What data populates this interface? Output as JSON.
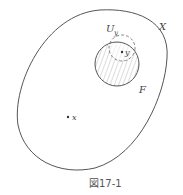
{
  "figure": {
    "caption": "図17-1",
    "labels": {
      "space": "X",
      "neighborhood": "U",
      "neighborhood_sub": "y",
      "closed_set": "F",
      "point_y": "y",
      "point_x": "x"
    },
    "colors": {
      "stroke": "#555555",
      "hatch": "#888888",
      "background": "#ffffff"
    }
  }
}
